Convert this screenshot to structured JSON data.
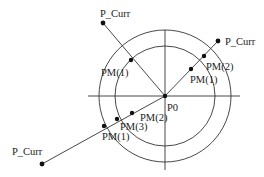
{
  "diagram": {
    "center": {
      "label": "P0",
      "x": 165,
      "y": 96
    },
    "axes": {
      "horizontal": {
        "x1": 88,
        "x2": 240,
        "y": 96
      },
      "vertical": {
        "x": 165,
        "y1": 30,
        "y2": 170
      }
    },
    "circles": [
      {
        "name": "outer-circle",
        "r": 66
      },
      {
        "name": "inner-circle",
        "r": 50
      }
    ],
    "rays": [
      {
        "name": "ray-top-left",
        "end": {
          "label": "P_Curr",
          "x": 103,
          "y": 23,
          "lx": 100,
          "ly": 17
        },
        "points": [
          {
            "label": "PM(1)",
            "x": 131,
            "y": 60,
            "lx": 101,
            "ly": 76
          }
        ]
      },
      {
        "name": "ray-top-right",
        "end": {
          "label": "P_Curr",
          "x": 218,
          "y": 41,
          "lx": 225,
          "ly": 45
        },
        "points": [
          {
            "label": "PM(2)",
            "x": 204,
            "y": 56,
            "lx": 206,
            "ly": 70
          },
          {
            "label": "PM(1)",
            "x": 191,
            "y": 69,
            "lx": 190,
            "ly": 83
          }
        ]
      },
      {
        "name": "ray-bottom-left",
        "end": {
          "label": "P_Curr",
          "x": 42,
          "y": 164,
          "lx": 12,
          "ly": 155
        },
        "points": [
          {
            "label": "PM(1)",
            "x": 104,
            "y": 126,
            "lx": 102,
            "ly": 140
          },
          {
            "label": "PM(3)",
            "x": 117,
            "y": 119,
            "lx": 120,
            "ly": 130
          },
          {
            "label": "PM(2)",
            "x": 132,
            "y": 113,
            "lx": 140,
            "ly": 121
          }
        ]
      }
    ],
    "center_label_pos": {
      "lx": 167,
      "ly": 111
    },
    "colors": {
      "stroke": "#333333",
      "dot": "#111111",
      "text": "#222222"
    }
  }
}
